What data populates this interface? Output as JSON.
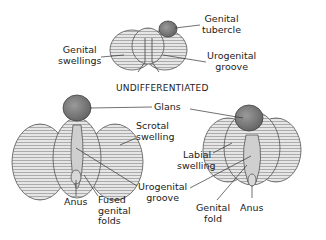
{
  "diagram": {
    "heading": "UNDIFFERENTIATED",
    "undifferentiated": {
      "labels": {
        "genital_tubercle_1": "Genital",
        "genital_tubercle_2": "tubercle",
        "genital_swellings_1": "Genital",
        "genital_swellings_2": "swellings",
        "urogenital_groove_1": "Urogenital",
        "urogenital_groove_2": "groove"
      }
    },
    "male": {
      "labels": {
        "glans": "Glans",
        "scrotal_swelling_1": "Scrotal",
        "scrotal_swelling_2": "swelling",
        "anus": "Anus",
        "fused_genital_folds_1": "Fused",
        "fused_genital_folds_2": "genital",
        "fused_genital_folds_3": "folds"
      }
    },
    "female": {
      "labels": {
        "labial_swelling_1": "Labial",
        "labial_swelling_2": "swelling",
        "urogenital_groove_1": "Urogenital",
        "urogenital_groove_2": "groove",
        "genital_fold_1": "Genital",
        "genital_fold_2": "fold",
        "anus": "Anus"
      }
    },
    "colors": {
      "tissue": "#d4d4d4",
      "tissue_dark": "#9a9a9a",
      "glans": "#7d7d7d",
      "line": "#333333"
    }
  }
}
